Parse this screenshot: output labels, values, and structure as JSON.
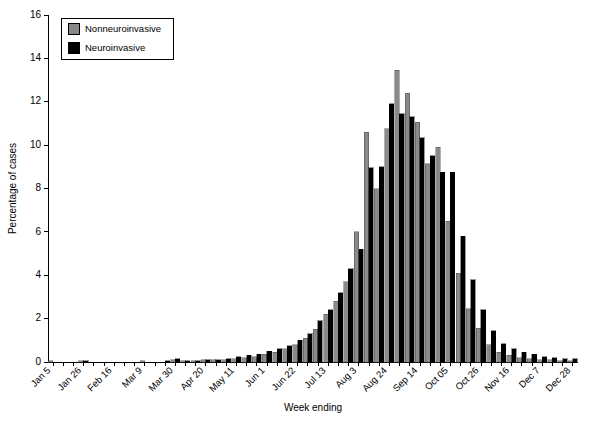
{
  "chart_data": {
    "type": "bar",
    "title": "",
    "xlabel": "Week ending",
    "ylabel": "Percentage of cases",
    "ylim": [
      0,
      16
    ],
    "ytick_values": [
      0,
      2,
      4,
      6,
      8,
      10,
      12,
      14,
      16
    ],
    "ytick_labels": [
      "0",
      "2",
      "4",
      "6",
      "8",
      "10",
      "12",
      "14",
      "16"
    ],
    "grid": false,
    "legend_position": "upper-left",
    "bar_mode": "grouped",
    "categories": [
      "Jan 5",
      "Jan 12",
      "Jan 19",
      "Jan 26",
      "Feb 2",
      "Feb 9",
      "Feb 16",
      "Feb 23",
      "Mar 2",
      "Mar 9",
      "Mar 16",
      "Mar 23",
      "Mar 30",
      "Apr 6",
      "Apr 13",
      "Apr 20",
      "Apr 27",
      "May 4",
      "May 11",
      "May 18",
      "May 25",
      "Jun 1",
      "Jun 8",
      "Jun 15",
      "Jun 22",
      "Jun 29",
      "Jul 6",
      "Jul 13",
      "Jul 20",
      "Jul 27",
      "Aug 3",
      "Aug 10",
      "Aug 17",
      "Aug 24",
      "Aug 31",
      "Sep 7",
      "Sep 14",
      "Sep 21",
      "Sep 28",
      "Oct 05",
      "Oct 12",
      "Oct 19",
      "Oct 26",
      "Nov 2",
      "Nov 9",
      "Nov 16",
      "Nov 23",
      "Nov 30",
      "Dec 7",
      "Dec 14",
      "Dec 21",
      "Dec 28"
    ],
    "xtick_labels": [
      "Jan 5",
      "Jan 26",
      "Feb 16",
      "Mar 9",
      "Mar 30",
      "Apr 20",
      "May 11",
      "Jun 1",
      "Jun 22",
      "Jul 13",
      "Aug 3",
      "Aug 24",
      "Sep 14",
      "Oct 05",
      "Oct 26",
      "Nov 16",
      "Dec 7",
      "Dec 28"
    ],
    "xtick_indices": [
      0,
      3,
      6,
      9,
      12,
      15,
      18,
      21,
      24,
      27,
      30,
      33,
      36,
      39,
      42,
      45,
      48,
      51
    ],
    "series": [
      {
        "name": "Nonneuroinvasive",
        "color": "#8a8a8a",
        "values": [
          0.05,
          0.0,
          0.0,
          0.05,
          0.0,
          0.0,
          0.0,
          0.0,
          0.0,
          0.05,
          0.0,
          0.0,
          0.1,
          0.05,
          0.05,
          0.1,
          0.1,
          0.1,
          0.15,
          0.2,
          0.25,
          0.35,
          0.45,
          0.6,
          0.8,
          1.1,
          1.5,
          2.2,
          2.8,
          3.7,
          6.0,
          10.6,
          8.0,
          10.75,
          13.45,
          12.4,
          11.05,
          9.15,
          9.9,
          6.5,
          4.1,
          2.45,
          1.55,
          0.8,
          0.45,
          0.3,
          0.2,
          0.15,
          0.1,
          0.1,
          0.05,
          0.05
        ]
      },
      {
        "name": "Neuroinvasive",
        "color": "#000000",
        "values": [
          0.0,
          0.0,
          0.0,
          0.05,
          0.0,
          0.0,
          0.0,
          0.0,
          0.0,
          0.0,
          0.0,
          0.05,
          0.15,
          0.05,
          0.05,
          0.1,
          0.1,
          0.15,
          0.25,
          0.3,
          0.35,
          0.5,
          0.6,
          0.75,
          1.0,
          1.3,
          1.9,
          2.4,
          3.2,
          4.3,
          5.2,
          8.95,
          9.0,
          11.9,
          11.45,
          11.3,
          10.35,
          9.5,
          8.75,
          8.75,
          5.8,
          3.8,
          2.4,
          1.45,
          0.85,
          0.6,
          0.45,
          0.35,
          0.25,
          0.2,
          0.15,
          0.15
        ]
      }
    ]
  },
  "legend": {
    "entries": [
      {
        "label": "Nonneuroinvasive",
        "swatch": "gray-swatch"
      },
      {
        "label": "Neuroinvasive",
        "swatch": "black-swatch"
      }
    ]
  },
  "axes": {
    "y_title": "Percentage of cases",
    "x_title": "Week ending"
  }
}
